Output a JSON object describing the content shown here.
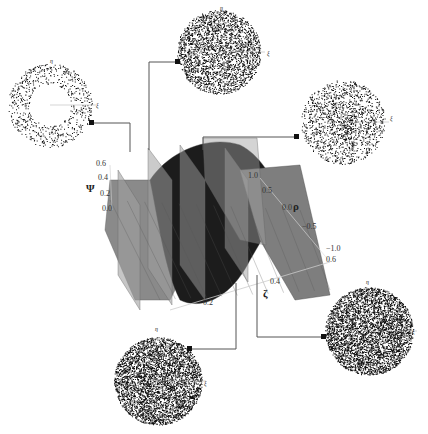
{
  "figure": {
    "surface": {
      "z_axis": {
        "label": "Ψ",
        "ticks": [
          "0.0",
          "0.2",
          "0.4",
          "0.6"
        ]
      },
      "rho_axis": {
        "label": "ρ",
        "ticks": [
          "1.0",
          "0.5",
          "0.0",
          "−0.5",
          "−1.0"
        ]
      },
      "zeta_axis": {
        "label": "ζ",
        "ticks": [
          "0.2",
          "0.4",
          "0.6"
        ]
      },
      "colors": {
        "surface_dark": "#1a1a1a",
        "surface_light": "#8a8a8a",
        "plane": "#9a9a9a",
        "connector": "#555555"
      }
    },
    "disks": [
      {
        "id": "disk-left",
        "label_x": "ξ",
        "label_y": "η",
        "density": "sparse-ring"
      },
      {
        "id": "disk-top",
        "label_x": "ξ",
        "label_y": "η",
        "density": "medium"
      },
      {
        "id": "disk-right",
        "label_x": "ξ",
        "label_y": "η",
        "density": "medium-center"
      },
      {
        "id": "disk-bottom-right",
        "label_x": "ξ",
        "label_y": "η",
        "density": "dense"
      },
      {
        "id": "disk-bottom-left",
        "label_x": "ξ",
        "label_y": "η",
        "density": "dense"
      }
    ]
  }
}
